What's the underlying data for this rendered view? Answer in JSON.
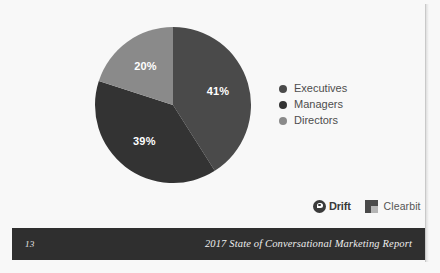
{
  "slide": {
    "background_color": "#f8f8f8",
    "page_edge_color": "#c9c9c9"
  },
  "chart_data": {
    "type": "pie",
    "title": "",
    "categories": [
      "Executives",
      "Managers",
      "Directors"
    ],
    "values": [
      41,
      39,
      20
    ],
    "value_labels": [
      "41%",
      "39%",
      "20%"
    ],
    "colors": [
      "#4a4a4a",
      "#333333",
      "#8a8a8a"
    ],
    "units": "percent",
    "start_angle_deg": 0,
    "direction": "clockwise",
    "legend_position": "right",
    "grid": false,
    "label_color": "#ffffff"
  },
  "legend": {
    "items": [
      {
        "label": "Executives",
        "color": "#4a4a4a"
      },
      {
        "label": "Managers",
        "color": "#333333"
      },
      {
        "label": "Directors",
        "color": "#8a8a8a"
      }
    ]
  },
  "logos": {
    "drift": {
      "name": "Drift",
      "mark": "drift-logo-icon",
      "color": "#3a3a3a"
    },
    "clearbit": {
      "name": "Clearbit",
      "mark": "clearbit-logo-icon",
      "color": "#4a4a4a"
    }
  },
  "footer": {
    "page_number": "13",
    "title": "2017 State of Conversational Marketing Report",
    "bar_color": "#2f2f2f",
    "text_color": "#eeeeee"
  }
}
